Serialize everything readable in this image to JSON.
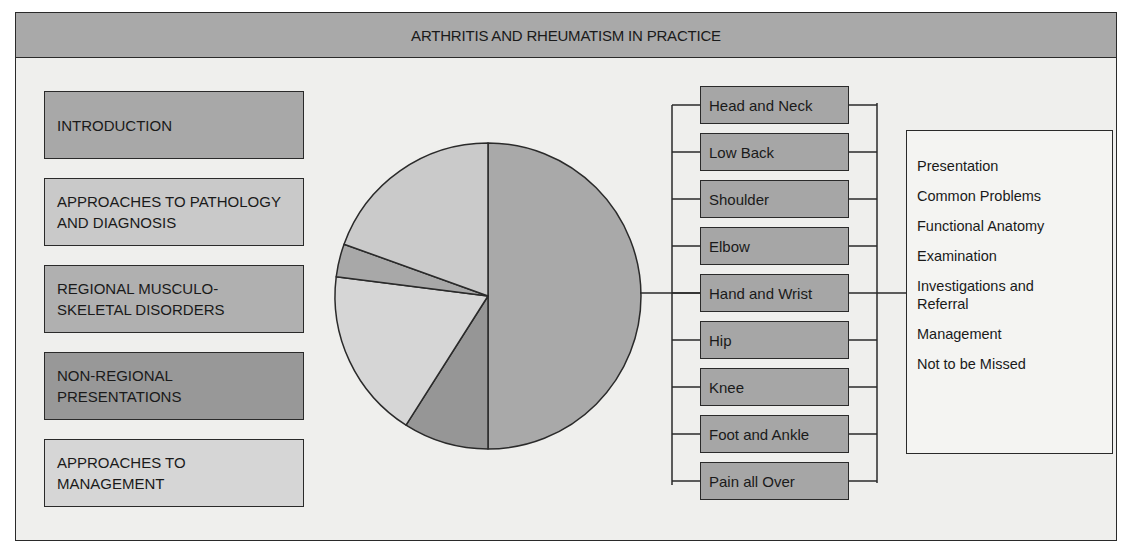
{
  "title": "ARTHRITIS AND RHEUMATISM IN PRACTICE",
  "sections": [
    {
      "label": "INTRODUCTION",
      "fill": "#a8a8a8"
    },
    {
      "label": "APPROACHES TO PATHOLOGY\nAND DIAGNOSIS",
      "fill": "#c9c9c9"
    },
    {
      "label": "REGIONAL  MUSCULO-\nSKELETAL DISORDERS",
      "fill": "#b0b0b0"
    },
    {
      "label": "NON-REGIONAL\nPRESENTATIONS",
      "fill": "#989898"
    },
    {
      "label": "APPROACHES TO\nMANAGEMENT",
      "fill": "#d6d6d6"
    }
  ],
  "regions": [
    {
      "label": "Head and Neck"
    },
    {
      "label": "Low Back"
    },
    {
      "label": "Shoulder"
    },
    {
      "label": "Elbow"
    },
    {
      "label": "Hand and Wrist"
    },
    {
      "label": "Hip"
    },
    {
      "label": "Knee"
    },
    {
      "label": "Foot and Ankle"
    },
    {
      "label": "Pain all Over"
    }
  ],
  "chapter_structure": [
    {
      "label": "Presentation"
    },
    {
      "label": "Common Problems"
    },
    {
      "label": "Functional Anatomy"
    },
    {
      "label": "Examination"
    },
    {
      "label": "Investigations and\nReferral"
    },
    {
      "label": "Management"
    },
    {
      "label": "Not to be Missed"
    }
  ],
  "chart_data": {
    "type": "pie",
    "title": "ARTHRITIS AND RHEUMATISM IN PRACTICE",
    "categories": [
      "Regional Musculo-skeletal Disorders",
      "Non-Regional Presentations",
      "Approaches to Management",
      "Introduction",
      "Approaches to Pathology and Diagnosis"
    ],
    "values": [
      50,
      9,
      18,
      3.5,
      19.5
    ],
    "colors": [
      "#a9a9a9",
      "#969696",
      "#d6d6d6",
      "#a8a8a8",
      "#cacaca"
    ],
    "start_angle_deg": 0,
    "direction": "clockwise",
    "legend": "none (boxes at left act as key)"
  }
}
